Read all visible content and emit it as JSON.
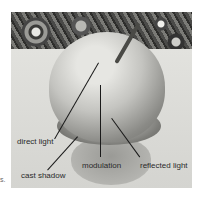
{
  "figure": {
    "labels": {
      "direct_light": "direct light",
      "cast_shadow": "cast shadow",
      "modulation": "modulation",
      "reflected_light": "reflected light"
    },
    "edge_fragment": "s."
  }
}
